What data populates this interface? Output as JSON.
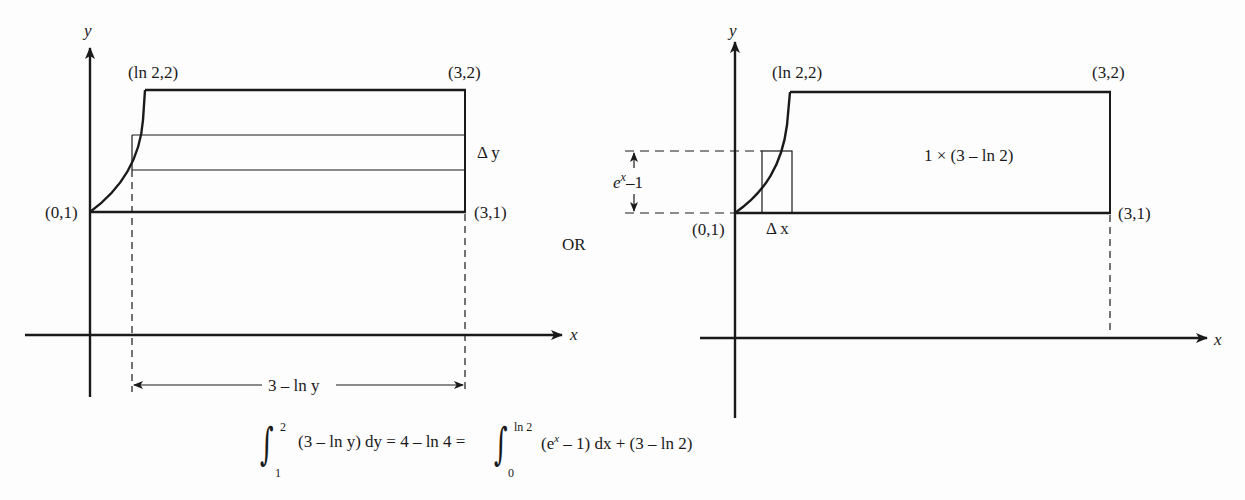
{
  "left_diagram": {
    "axis_labels": {
      "x": "x",
      "y": "y"
    },
    "points": {
      "top_left": "(ln 2,2)",
      "top_right": "(3,2)",
      "bottom_left": "(0,1)",
      "bottom_right": "(3,1)"
    },
    "strip_label": "Δ y",
    "width_label": "3 – ln y"
  },
  "separator": "OR",
  "right_diagram": {
    "axis_labels": {
      "x": "x",
      "y": "y"
    },
    "points": {
      "top_left": "(ln 2,2)",
      "top_right": "(3,2)",
      "bottom_left": "(0,1)",
      "bottom_right": "(3,1)"
    },
    "height_label_base": "e",
    "height_label_sup": "x",
    "height_label_rest": "–1",
    "strip_label": "Δ x",
    "rectangle_label": "1 × (3 – ln 2)"
  },
  "formula": {
    "int1_upper": "2",
    "int1_lower": "1",
    "int1_body": "(3 – ln y) dy = 4 – ln 4 =",
    "int2_upper": "ln 2",
    "int2_lower": "0",
    "int2_body_a": "(e",
    "int2_body_sup": "x",
    "int2_body_b": " – 1) dx + (3 – ln 2)",
    "integral_sign": "∫"
  }
}
